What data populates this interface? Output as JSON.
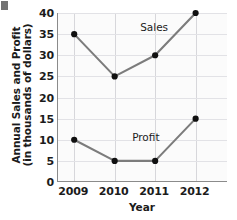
{
  "chart_data": {
    "type": "line",
    "title": "",
    "subtitle": "",
    "xlabel": "Year",
    "ylabel": "Annual Sales and Profit",
    "ylabel_line1": "Annual Sales and Profit",
    "ylabel_line2": "(in thousands of dollars)",
    "categories": [
      "2009",
      "2010",
      "2011",
      "2012"
    ],
    "x": [
      2009,
      2010,
      2011,
      2012
    ],
    "xlim": [
      2008.6,
      2012.8
    ],
    "ylim": [
      0,
      40
    ],
    "yticks": [
      0,
      5,
      10,
      15,
      20,
      25,
      30,
      35,
      40
    ],
    "xticks": [
      "2009",
      "2010",
      "2011",
      "2012"
    ],
    "grid": true,
    "legend_position": "inline-annotations",
    "series": [
      {
        "name": "Sales",
        "values": [
          35,
          25,
          30,
          40
        ],
        "color": "#7c7c7c",
        "marker_color": "#101010"
      },
      {
        "name": "Profit",
        "values": [
          10,
          5,
          5,
          15
        ],
        "color": "#7c7c7c",
        "marker_color": "#101010"
      }
    ],
    "annotations": [
      {
        "text": "Sales",
        "series": "Sales"
      },
      {
        "text": "Profit",
        "series": "Profit"
      }
    ]
  },
  "colors": {
    "line": "#7c7c7c",
    "marker": "#101010",
    "axis": "#8b8b8b",
    "grid_horizontal": "#e2e2e6",
    "grid_vertical": "#d7d7db",
    "plot_background": "#fbfbfb",
    "text": "#1b1b1b"
  }
}
